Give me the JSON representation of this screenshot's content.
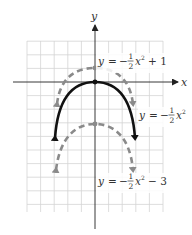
{
  "axes": {
    "x_label": "x",
    "y_label": "y",
    "origin_px": [
      95,
      82
    ],
    "unit_px": 13.6,
    "grid_x_range": [
      -5,
      5
    ],
    "grid_y_range": [
      -9.5,
      3
    ]
  },
  "curves": [
    {
      "name": "y = -1/2 x^2 + 1",
      "style": "dashed",
      "color": "#8a8a8a",
      "label": {
        "lhs": "y",
        "eq": "=",
        "sign": "−",
        "num": "1",
        "den": "2",
        "var": "x",
        "exp": "2",
        "tail": "+ 1"
      }
    },
    {
      "name": "y = -1/2 x^2",
      "style": "solid",
      "color": "#111111",
      "label": {
        "lhs": "y",
        "eq": "=",
        "sign": "−",
        "num": "1",
        "den": "2",
        "var": "x",
        "exp": "2",
        "tail": ""
      }
    },
    {
      "name": "y = -1/2 x^2 - 3",
      "style": "dashed",
      "color": "#8a8a8a",
      "label": {
        "lhs": "y",
        "eq": "=",
        "sign": "−",
        "num": "1",
        "den": "2",
        "var": "x",
        "exp": "2",
        "tail": "− 3"
      }
    }
  ],
  "colors": {
    "grid": "#d4d4d4",
    "axis": "#222222",
    "solid_curve": "#111111",
    "dashed_curve": "#8a8a8a"
  }
}
